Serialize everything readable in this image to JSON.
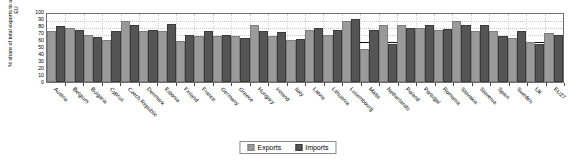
{
  "chart_data": {
    "type": "bar",
    "title": "",
    "xlabel": "",
    "ylabel": "% share of total exports to and imports from the EU",
    "ylim": [
      0,
      100
    ],
    "yticks": [
      0,
      10,
      20,
      30,
      40,
      50,
      60,
      70,
      80,
      90,
      100
    ],
    "grid": true,
    "legend_position": "bottom-center",
    "categories": [
      "Austria",
      "Belgium",
      "Bulgaria",
      "Cyprus",
      "Czech Republic",
      "Denmark",
      "Estonia",
      "Finland",
      "France",
      "Germany",
      "Greece",
      "Hungary",
      "Ireland",
      "Italy",
      "Latvia",
      "Lithuania",
      "Luxembourg",
      "Malta",
      "Netherlands",
      "Poland",
      "Portugal",
      "Romania",
      "Slovakia",
      "Slovenia",
      "Spain",
      "Sweden",
      "UK",
      "EU27"
    ],
    "series": [
      {
        "name": "Exports",
        "color": "#9a9a9a",
        "values": [
          70,
          75,
          65,
          57,
          84,
          70,
          70,
          56,
          63,
          63,
          63,
          79,
          63,
          57,
          72,
          65,
          85,
          45,
          79,
          79,
          75,
          72,
          85,
          70,
          70,
          60,
          54,
          67
        ]
      },
      {
        "name": "Imports",
        "color": "#555555",
        "values": [
          77,
          72,
          62,
          70,
          79,
          72,
          80,
          65,
          70,
          65,
          60,
          70,
          68,
          58,
          75,
          72,
          87,
          72,
          52,
          74,
          78,
          73,
          78,
          79,
          63,
          70,
          52,
          64
        ]
      }
    ]
  },
  "legend": {
    "items": [
      {
        "label": "Exports"
      },
      {
        "label": "Imports"
      }
    ]
  }
}
